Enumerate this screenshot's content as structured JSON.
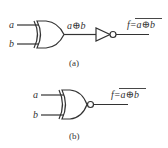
{
  "diagram_a": {
    "input_a": "a",
    "input_b": "b",
    "gate_type": "XOR",
    "intermediate_label": "a⊕b",
    "inverter": "NOT",
    "output_prefix": "f=",
    "output_expr": "a⊕b",
    "output_overline": true,
    "caption": "(a)"
  },
  "diagram_b": {
    "input_a": "a",
    "input_b": "b",
    "gate_type": "XNOR",
    "output_prefix": "f=",
    "output_expr": "a⊕b",
    "output_overline": true,
    "caption": "(b)"
  },
  "colors": {
    "line": "#333333",
    "background": "#ffffff"
  }
}
